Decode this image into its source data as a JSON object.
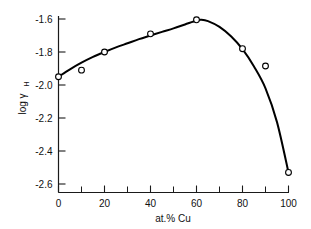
{
  "chart_data": {
    "type": "scatter",
    "title": "",
    "subtitle": "",
    "xlabel": "at.% Cu",
    "ylabel": "log γ",
    "ylabel_subscript": "H",
    "xlim": [
      0,
      100
    ],
    "ylim": [
      -2.7,
      -1.55
    ],
    "grid": false,
    "legend": null,
    "x_ticks_major": [
      0,
      20,
      40,
      60,
      80,
      100
    ],
    "x_tick_labels": [
      "0",
      "20",
      "40",
      "60",
      "80",
      "100"
    ],
    "x_ticks_minor": [
      10,
      30,
      50,
      70,
      90
    ],
    "y_ticks_major": [
      -1.6,
      -1.8,
      -2.0,
      -2.2,
      -2.4,
      -2.6
    ],
    "y_tick_labels": [
      "-1.6",
      "-1.8",
      "-2.0",
      "-2.2",
      "-2.4",
      "-2.6"
    ],
    "series": [
      {
        "name": "measured points",
        "marker": "open-circle",
        "x": [
          0,
          10,
          20,
          40,
          60,
          80,
          90,
          100
        ],
        "values": [
          -1.95,
          -1.91,
          -1.8,
          -1.69,
          -1.605,
          -1.78,
          -1.885,
          -2.53
        ]
      },
      {
        "name": "fitted curve",
        "marker": "none",
        "x": [
          0,
          5,
          10,
          15,
          20,
          25,
          30,
          35,
          40,
          45,
          50,
          55,
          60,
          62,
          65,
          70,
          75,
          80,
          85,
          90,
          95,
          100
        ],
        "values": [
          -1.95,
          -1.905,
          -1.865,
          -1.83,
          -1.8,
          -1.772,
          -1.747,
          -1.722,
          -1.7,
          -1.678,
          -1.657,
          -1.633,
          -1.609,
          -1.605,
          -1.613,
          -1.648,
          -1.705,
          -1.783,
          -1.888,
          -2.02,
          -2.225,
          -2.53
        ]
      }
    ]
  },
  "axis_titles": {
    "x": "at.% Cu",
    "y_main": "log γ",
    "y_sub": "H"
  },
  "colors": {
    "axis": "#1a1a1a",
    "curve": "#000000",
    "marker_fill": "#ffffff",
    "background": "#ffffff"
  }
}
